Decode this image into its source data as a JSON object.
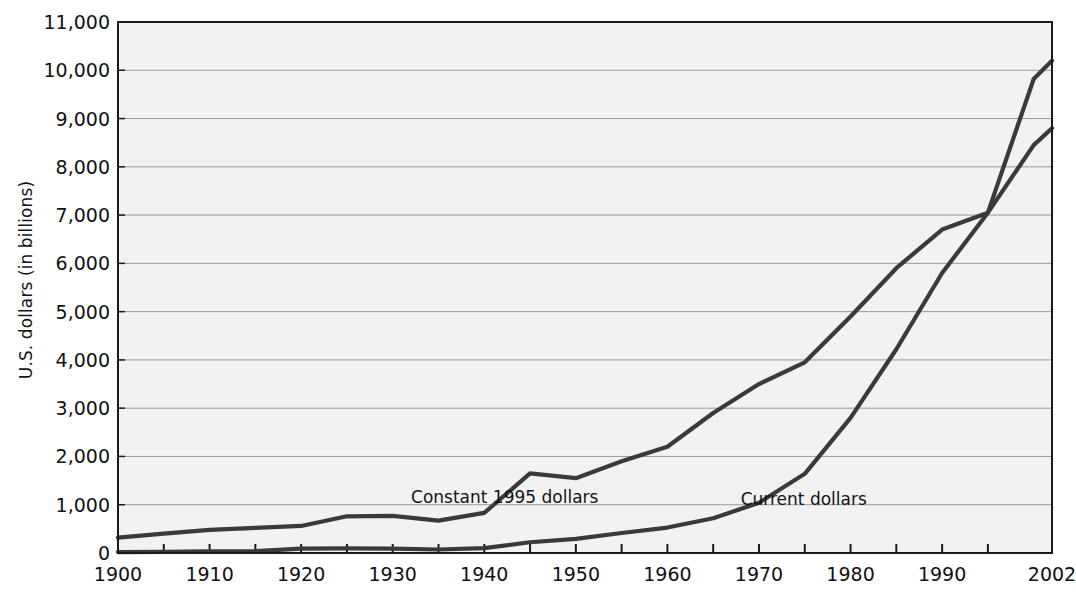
{
  "chart_data": {
    "type": "line",
    "title": "",
    "xlabel": "",
    "ylabel": "U.S. dollars (in billions)",
    "xlim": [
      1900,
      2002
    ],
    "ylim": [
      0,
      11000
    ],
    "grid": true,
    "legend_position": "inline-annotation",
    "x_tick_labels": [
      "1900",
      "1910",
      "1920",
      "1930",
      "1940",
      "1950",
      "1960",
      "1970",
      "1980",
      "1990",
      "2002"
    ],
    "x_tick_values": [
      1900,
      1910,
      1920,
      1930,
      1940,
      1950,
      1960,
      1970,
      1980,
      1990,
      2002
    ],
    "x_minor_tick_values": [
      1905,
      1915,
      1925,
      1935,
      1945,
      1955,
      1965,
      1975,
      1985,
      1995
    ],
    "y_tick_labels": [
      "0",
      "1,000",
      "2,000",
      "3,000",
      "4,000",
      "5,000",
      "6,000",
      "7,000",
      "8,000",
      "9,000",
      "10,000",
      "11,000"
    ],
    "y_tick_values": [
      0,
      1000,
      2000,
      3000,
      4000,
      5000,
      6000,
      7000,
      8000,
      9000,
      10000,
      11000
    ],
    "series": [
      {
        "name": "Constant 1995 dollars",
        "label_x": 1932,
        "label_y": 1330,
        "color": "#3a3a3a",
        "x": [
          1900,
          1905,
          1910,
          1915,
          1920,
          1925,
          1930,
          1935,
          1940,
          1945,
          1950,
          1955,
          1960,
          1965,
          1970,
          1975,
          1980,
          1985,
          1990,
          1995,
          2000,
          2002
        ],
        "values": [
          320,
          400,
          480,
          520,
          560,
          760,
          770,
          670,
          830,
          1650,
          1550,
          1900,
          2200,
          2900,
          3500,
          3950,
          4900,
          5900,
          6700,
          7050,
          8450,
          8800
        ]
      },
      {
        "name": "Current dollars",
        "label_x": 1968,
        "label_y": 1280,
        "color": "#3a3a3a",
        "x": [
          1900,
          1905,
          1910,
          1915,
          1920,
          1925,
          1930,
          1935,
          1940,
          1945,
          1950,
          1955,
          1960,
          1965,
          1970,
          1975,
          1980,
          1985,
          1990,
          1995,
          2000,
          2002
        ],
        "values": [
          20,
          25,
          35,
          40,
          90,
          95,
          92,
          73,
          100,
          223,
          294,
          415,
          527,
          720,
          1040,
          1640,
          2800,
          4220,
          5800,
          7050,
          9820,
          10200
        ]
      }
    ]
  },
  "axis": {
    "y_title": "U.S. dollars (in billions)"
  },
  "colors": {
    "plot_background": "#f2f2f2",
    "gridline": "#9a9a9a",
    "axis": "#1a1a1a",
    "line": "#3a3a3a",
    "page_background": "#ffffff"
  }
}
